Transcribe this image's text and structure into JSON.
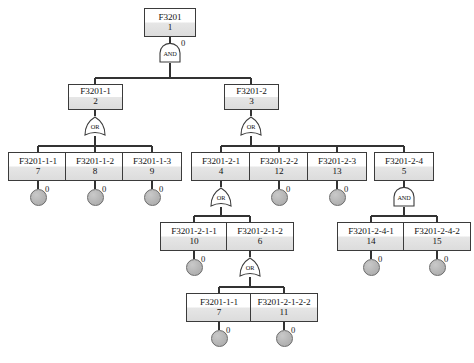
{
  "diagram": {
    "type": "fault-tree",
    "title": "",
    "gate_annotation_value": "0",
    "basic_event_annotation_value": "0",
    "colors": {
      "box_border": "#3b3b3b",
      "box_fill_top": "#ffffff",
      "box_fill_bottom": "#dcdcdc",
      "circle_fill": "#b3b3b3",
      "circle_border": "#6a6a6a",
      "wire": "#333333",
      "background": "#ffffff"
    }
  },
  "nodes": {
    "top": {
      "id": "F3201",
      "num": "1"
    },
    "l2a": {
      "id": "F3201-1",
      "num": "2"
    },
    "l2b": {
      "id": "F3201-2",
      "num": "3"
    },
    "l3a": {
      "id": "F3201-1-1",
      "num": "7"
    },
    "l3b": {
      "id": "F3201-1-2",
      "num": "8"
    },
    "l3c": {
      "id": "F3201-1-3",
      "num": "9"
    },
    "l3d": {
      "id": "F3201-2-1",
      "num": "4"
    },
    "l3e": {
      "id": "F3201-2-2",
      "num": "12"
    },
    "l3f": {
      "id": "F3201-2-3",
      "num": "13"
    },
    "l3g": {
      "id": "F3201-2-4",
      "num": "5"
    },
    "l4a": {
      "id": "F3201-2-1-1",
      "num": "10"
    },
    "l4b": {
      "id": "F3201-2-1-2",
      "num": "6"
    },
    "l4c": {
      "id": "F3201-2-4-1",
      "num": "14"
    },
    "l4d": {
      "id": "F3201-2-4-2",
      "num": "15"
    },
    "l5a": {
      "id": "F3201-1-1",
      "num": "7"
    },
    "l5b": {
      "id": "F3201-2-1-2-2",
      "num": "11"
    }
  },
  "gates": {
    "g_top": {
      "type": "AND",
      "label": "AND",
      "annotation": "0"
    },
    "g_l2a": {
      "type": "OR",
      "label": "OR",
      "annotation": ""
    },
    "g_l2b": {
      "type": "OR",
      "label": "OR",
      "annotation": ""
    },
    "g_l3d": {
      "type": "OR",
      "label": "OR",
      "annotation": ""
    },
    "g_l3g": {
      "type": "AND",
      "label": "AND",
      "annotation": ""
    },
    "g_l4b": {
      "type": "OR",
      "label": "OR",
      "annotation": ""
    }
  },
  "basic_events": {
    "be_l3a": {
      "annotation": "0"
    },
    "be_l3b": {
      "annotation": "0"
    },
    "be_l3c": {
      "annotation": "0"
    },
    "be_l3e": {
      "annotation": "0"
    },
    "be_l3f": {
      "annotation": "0"
    },
    "be_l4a": {
      "annotation": "0"
    },
    "be_l4c": {
      "annotation": "0"
    },
    "be_l4d": {
      "annotation": "0"
    },
    "be_l5a": {
      "annotation": "0"
    },
    "be_l5b": {
      "annotation": "0"
    }
  }
}
